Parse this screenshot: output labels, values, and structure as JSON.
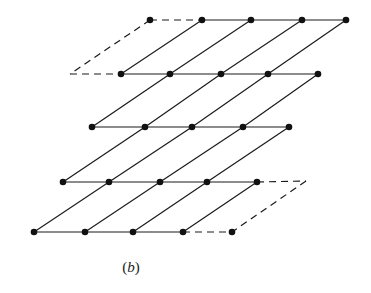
{
  "figure": {
    "caption": {
      "open": "(",
      "letter": "b",
      "close": ")"
    },
    "colors": {
      "line": "#1a1a1a",
      "dot": "#111111",
      "background": "#ffffff"
    },
    "dot_radius": 3.3,
    "rows": [
      {
        "y": 20,
        "xs": [
          150,
          202,
          251,
          302,
          346
        ]
      },
      {
        "y": 74,
        "xs": [
          121,
          170,
          221,
          268,
          318
        ]
      },
      {
        "y": 127,
        "xs": [
          92,
          145,
          192,
          243,
          289
        ]
      },
      {
        "y": 182,
        "xs": [
          63,
          109,
          160,
          207,
          257
        ]
      },
      {
        "y": 232,
        "xs": [
          34,
          85,
          133,
          183,
          232
        ]
      }
    ],
    "horizontal_segments": [
      {
        "row": 0,
        "from": 0,
        "to": 1,
        "style": "dashed"
      },
      {
        "row": 0,
        "from": 1,
        "to": 4,
        "style": "solid"
      },
      {
        "row": 1,
        "from": 0,
        "to": 4,
        "style": "solid"
      },
      {
        "row": 2,
        "from": 0,
        "to": 4,
        "style": "solid"
      },
      {
        "row": 3,
        "from": 0,
        "to": 4,
        "style": "solid"
      },
      {
        "row": 4,
        "from": 0,
        "to": 3,
        "style": "solid"
      },
      {
        "row": 4,
        "from": 3,
        "to": 4,
        "style": "dashed"
      }
    ],
    "diagonal_links": [
      {
        "upper_row": 0,
        "lower_row": 1,
        "pairs": [
          [
            1,
            0
          ],
          [
            2,
            1
          ],
          [
            3,
            2
          ],
          [
            4,
            3
          ]
        ]
      },
      {
        "upper_row": 1,
        "lower_row": 2,
        "pairs": [
          [
            1,
            0
          ],
          [
            2,
            1
          ],
          [
            3,
            2
          ],
          [
            4,
            3
          ]
        ]
      },
      {
        "upper_row": 2,
        "lower_row": 3,
        "pairs": [
          [
            1,
            0
          ],
          [
            2,
            1
          ],
          [
            3,
            2
          ],
          [
            4,
            3
          ]
        ]
      },
      {
        "upper_row": 3,
        "lower_row": 4,
        "pairs": [
          [
            1,
            0
          ],
          [
            2,
            1
          ],
          [
            3,
            2
          ],
          [
            4,
            3
          ]
        ]
      }
    ],
    "extra_dashed": [
      {
        "x1": 150,
        "y1": 20,
        "x2": 70,
        "y2": 74
      },
      {
        "x1": 70,
        "y1": 74,
        "x2": 121,
        "y2": 74
      },
      {
        "x1": 257,
        "y1": 182,
        "x2": 306,
        "y2": 181
      },
      {
        "x1": 306,
        "y1": 181,
        "x2": 232,
        "y2": 232
      }
    ]
  }
}
